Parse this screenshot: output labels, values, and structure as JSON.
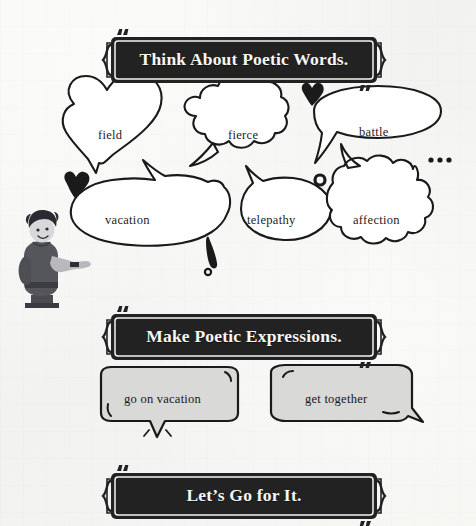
{
  "page": {
    "background_color": "#f5f5f3",
    "ink_color": "#1a1a1a",
    "banner_fill": "#222222",
    "banner_text_color": "#f7f7f5",
    "chip_fill": "#d9d9d7"
  },
  "banners": [
    {
      "id": "think-about-poetic-words",
      "label": "Think About Poetic Words."
    },
    {
      "id": "make-poetic-expressions",
      "label": "Make Poetic Expressions."
    },
    {
      "id": "lets-go-for-it",
      "label": "Let’s Go for It."
    }
  ],
  "word_bubbles": [
    {
      "id": "field",
      "label": "field",
      "shape": "heart-bubble"
    },
    {
      "id": "fierce",
      "label": "fierce",
      "shape": "cloud-bubble"
    },
    {
      "id": "battle",
      "label": "battle",
      "shape": "oval-bubble"
    },
    {
      "id": "vacation",
      "label": "vacation",
      "shape": "blob-bubble"
    },
    {
      "id": "telepathy",
      "label": "telepathy",
      "shape": "round-bubble"
    },
    {
      "id": "affection",
      "label": "affection",
      "shape": "cloud-bubble"
    }
  ],
  "expression_chips": [
    {
      "id": "go-on-vacation",
      "label": "go on vacation"
    },
    {
      "id": "get-together",
      "label": "get together"
    }
  ],
  "decorations": [
    {
      "id": "heart-small-left",
      "glyph": "heart"
    },
    {
      "id": "heart-small-top",
      "glyph": "heart"
    },
    {
      "id": "ellipsis-dots",
      "glyph": "dots"
    },
    {
      "id": "exclamation-mark",
      "glyph": "exclamation"
    },
    {
      "id": "period-dot",
      "glyph": "ring"
    }
  ],
  "illustration": {
    "id": "pointing-character",
    "description": "person pointing"
  }
}
